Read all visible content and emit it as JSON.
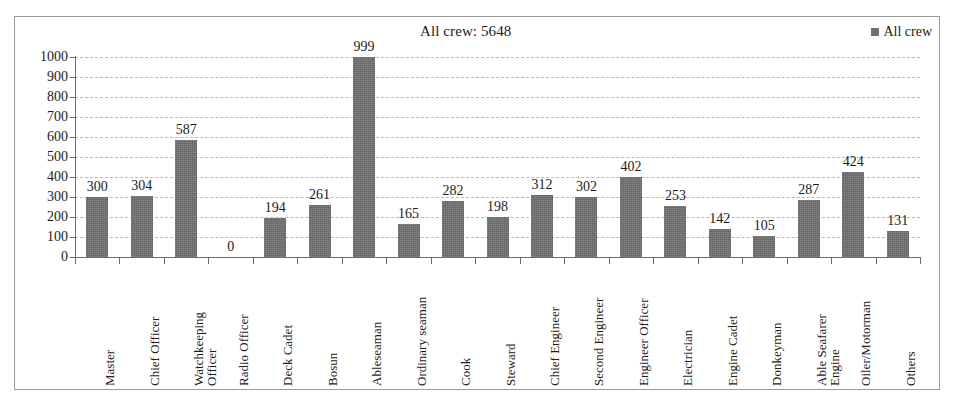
{
  "chart_data": {
    "type": "bar",
    "title": "All crew: 5648",
    "xlabel": "",
    "ylabel": "",
    "ylim": [
      0,
      1000
    ],
    "ytick_step": 100,
    "yticks": [
      "1000",
      "900",
      "800",
      "700",
      "600",
      "500",
      "400",
      "300",
      "200",
      "100",
      "0"
    ],
    "grid": true,
    "legend_position": "top-right",
    "legend": [
      "All crew"
    ],
    "series_name": "All crew",
    "bar_color": "#6f6f6f",
    "total": 5648,
    "categories": [
      "Master",
      "Chief Officer",
      "Watchkeeping\nOfficer",
      "Radio Officer",
      "Deck Cadet",
      "Bosun",
      "Ableseaman",
      "Ordinary seaman",
      "Cook",
      "Steward",
      "Chief Engineer",
      "Second Engineer",
      "Engineer Officer",
      "Electrician",
      "Engine Cadet",
      "Donkeyman",
      "Able Seafarer\nEngine",
      "Oiler/Motorman",
      "Others"
    ],
    "values": [
      300,
      304,
      587,
      0,
      194,
      261,
      999,
      165,
      282,
      198,
      312,
      302,
      402,
      253,
      142,
      105,
      287,
      424,
      131
    ],
    "value_labels": [
      "300",
      "304",
      "587",
      "0",
      "194",
      "261",
      "999",
      "165",
      "282",
      "198",
      "312",
      "302",
      "402",
      "253",
      "142",
      "105",
      "287",
      "424",
      "131"
    ]
  }
}
